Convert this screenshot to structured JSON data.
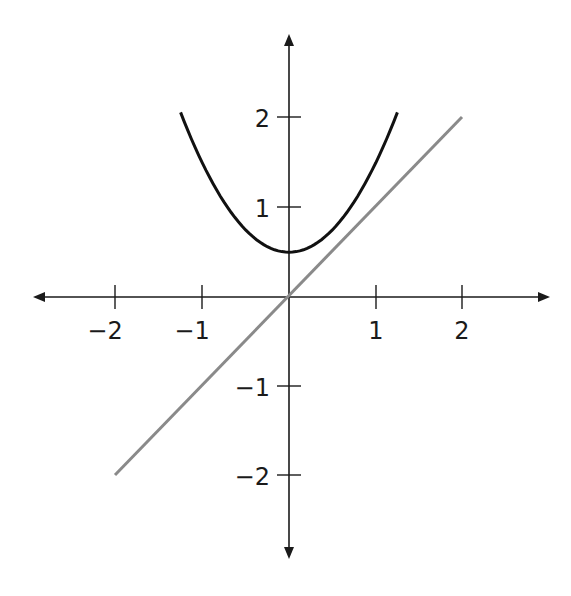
{
  "chart_data": {
    "type": "line",
    "title": "",
    "xlabel": "",
    "ylabel": "",
    "xlim": [
      -2.9,
      2.9
    ],
    "ylim": [
      -2.9,
      2.9
    ],
    "grid": false,
    "legend": null,
    "x_ticks": [
      "−2",
      "−1",
      "1",
      "2"
    ],
    "y_ticks": [
      "2",
      "1",
      "−1",
      "−2"
    ],
    "series": [
      {
        "name": "parabola",
        "equation": "y = x^2 + 0.5",
        "color": "#111111",
        "x": [
          -1.22,
          -1.0,
          -0.75,
          -0.5,
          -0.25,
          0,
          0.25,
          0.5,
          0.75,
          1.0,
          1.22
        ],
        "values": [
          1.99,
          1.5,
          1.06,
          0.75,
          0.56,
          0.5,
          0.56,
          0.75,
          1.06,
          1.5,
          1.99
        ]
      },
      {
        "name": "line",
        "equation": "y = x",
        "color": "#8a8a8a",
        "x": [
          -2,
          -1,
          0,
          1,
          2
        ],
        "values": [
          -2,
          -1,
          0,
          1,
          2
        ]
      }
    ]
  },
  "labels": {
    "x_neg2": "−2",
    "x_neg1": "−1",
    "x_1": "1",
    "x_2": "2",
    "y_2": "2",
    "y_1": "1",
    "y_neg1": "−1",
    "y_neg2": "−2"
  },
  "colors": {
    "axis": "#1a1a1a",
    "parabola": "#111111",
    "line": "#8a8a8a"
  }
}
